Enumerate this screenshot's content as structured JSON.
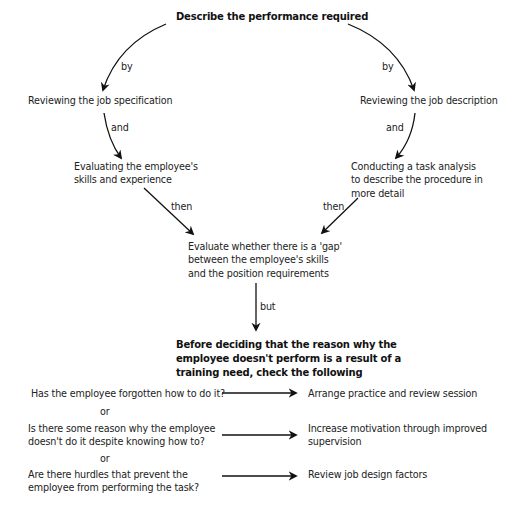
{
  "title": "Describe the performance required",
  "left_branch": {
    "connector_1": "by",
    "step_1": "Reviewing the job specification",
    "connector_2": "and",
    "step_2": [
      "Evaluating the employee's",
      "skills and experience"
    ],
    "connector_3": "then"
  },
  "right_branch": {
    "connector_1": "by",
    "step_1": "Reviewing the job description",
    "connector_2": "and",
    "step_2": [
      "Conducting a task analysis",
      "to describe the procedure in",
      "more detail"
    ],
    "connector_3": "then"
  },
  "merge": {
    "text": [
      "Evaluate whether there is a 'gap'",
      "between the employee's skills",
      "and the position requirements"
    ],
    "connector": "but"
  },
  "check": {
    "heading": [
      "Before deciding that the reason why the",
      "employee doesn't perform is a result of a",
      "training need, check the following"
    ]
  },
  "questions": [
    {
      "question": [
        "Has the employee forgotten how to do it?"
      ],
      "action": [
        "Arrange practice and review session"
      ]
    },
    {
      "question": [
        "Is there some reason why the employee",
        "doesn't do it despite knowing how to?"
      ],
      "action": [
        "Increase motivation through improved",
        "supervision"
      ]
    },
    {
      "question": [
        "Are there hurdles that prevent the",
        "employee from performing the task?"
      ],
      "action": [
        "Review job design factors"
      ]
    }
  ],
  "or_label": "or",
  "colors": {
    "ink": "#222222",
    "background": "#ffffff"
  }
}
